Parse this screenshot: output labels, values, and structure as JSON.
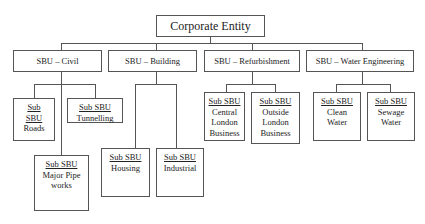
{
  "diagram": {
    "root": {
      "label": "Corporate Entity"
    },
    "sbus": [
      {
        "label": "SBU – Civil",
        "children": [
          {
            "title": "Sub SBU",
            "title_lines": [
              "Sub",
              "SBU"
            ],
            "name": "Roads"
          },
          {
            "title": "Sub SBU",
            "name": "Tunnelling"
          },
          {
            "title": "Sub SBU",
            "name_lines": [
              "Major Pipe",
              "works"
            ]
          }
        ]
      },
      {
        "label": "SBU – Building",
        "children": [
          {
            "title": "Sub SBU",
            "name": "Housing"
          },
          {
            "title": "Sub SBU",
            "name": "Industrial"
          }
        ]
      },
      {
        "label": "SBU – Refurbishment",
        "children": [
          {
            "title": "Sub SBU",
            "name_lines": [
              "Central",
              "London",
              "Business"
            ]
          },
          {
            "title": "Sub SBU",
            "name_lines": [
              "Outside",
              "London",
              "Business"
            ]
          }
        ]
      },
      {
        "label": "SBU – Water Engineering",
        "children": [
          {
            "title": "Sub SBU",
            "name_lines": [
              "Clean",
              "Water"
            ]
          },
          {
            "title": "Sub SBU",
            "name_lines": [
              "Sewage",
              "Water"
            ]
          }
        ]
      }
    ]
  },
  "colors": {
    "line": "#555555",
    "background": "#ffffff",
    "text": "#222222"
  }
}
